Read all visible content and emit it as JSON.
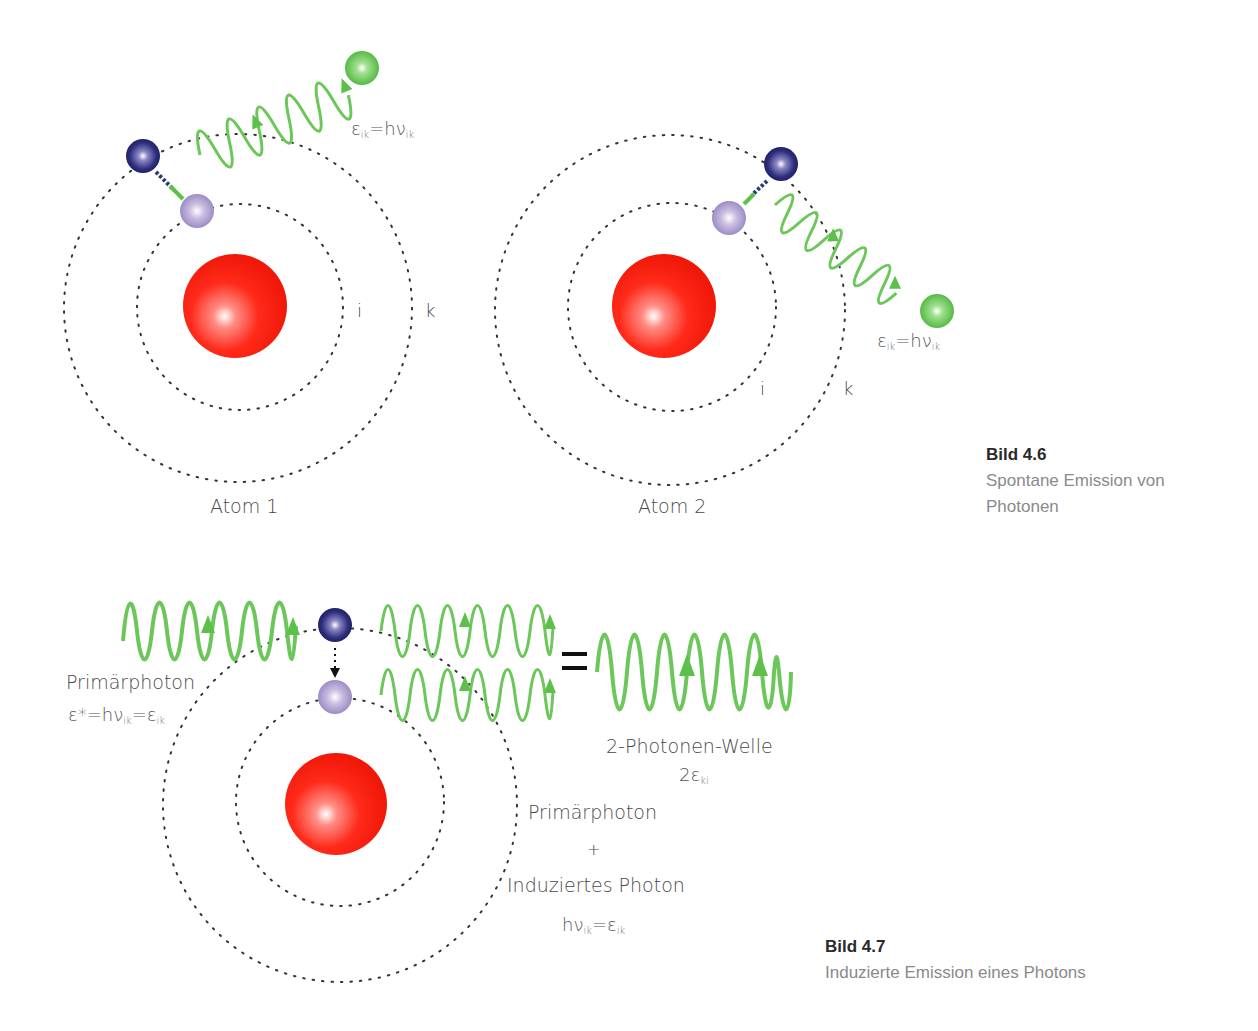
{
  "figure_4_6": {
    "caption_title": "Bild 4.6",
    "caption_text_line1": "Spontane Emission von",
    "caption_text_line2": "Photonen",
    "atom1": {
      "label": "Atom 1",
      "inner_orbit_label": "i",
      "outer_orbit_label": "k",
      "photon_energy": {
        "eps": "ε",
        "sub1": "ik",
        "eq": "=hν",
        "sub2": "ik"
      }
    },
    "atom2": {
      "label": "Atom 2",
      "inner_orbit_label": "i",
      "outer_orbit_label": "k",
      "photon_energy": {
        "eps": "ε",
        "sub1": "ik",
        "eq": "=hν",
        "sub2": "ik"
      }
    }
  },
  "figure_4_7": {
    "caption_title": "Bild 4.7",
    "caption_text": "Induzierte Emission eines Photons",
    "primary_photon_label": "Primärphoton",
    "primary_photon_formula": {
      "a": "ε*=hν",
      "s1": "ik",
      "b": "=ε",
      "s2": "ik"
    },
    "equals_sign": "=",
    "two_photon_label": "2-Photonen-Welle",
    "two_photon_formula": {
      "a": "2ε",
      "s1": "ki"
    },
    "sum_line1": "Primärphoton",
    "sum_plus": "+",
    "sum_line2": "Induziertes Photon",
    "sum_formula": {
      "a": "hν",
      "s1": "ik",
      "b": "=ε",
      "s2": "ik"
    }
  },
  "colors": {
    "nucleus": "#ff2a1a",
    "electron_outer": "#2a2a78",
    "electron_inner": "#a99acb",
    "photon_wave": "#6cc75a",
    "photon_ball": "#5cc04a",
    "orbit_dots": "#333333",
    "caption_title": "#2a2a2a",
    "caption_text": "#8a8a8a"
  }
}
